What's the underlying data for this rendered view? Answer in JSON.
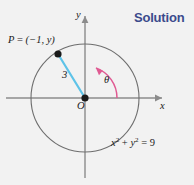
{
  "heading": {
    "text": "Solution",
    "color": "#3b4a8c"
  },
  "figure": {
    "background": "#f2f2f2",
    "axis_color": "#8c8c8c",
    "circle_color": "#6e6e6e",
    "radius_segment_color": "#5ec3e8",
    "angle_arc_color": "#e05a92",
    "point_color": "#1a1a1a",
    "labels": {
      "point_p": "P = (−1, y)",
      "point_p_plain": "P",
      "point_p_coords": "(−1, y)",
      "radius_value": "3",
      "angle_symbol": "θ",
      "origin": "O",
      "x_axis": "x",
      "y_axis": "y",
      "circle_equation": "x² + y² = 9",
      "circle_equation_lhs_x": "x",
      "circle_equation_lhs_y": "y",
      "circle_equation_exponent": "2",
      "circle_equation_rhs": "9"
    },
    "geometry": {
      "center_x": 85,
      "center_y": 98,
      "radius_px": 54,
      "point_p_x": 58,
      "point_p_y": 54,
      "point_p_math": [
        -1,
        2.828
      ],
      "circle_radius_math": 3,
      "angle_arc_start_deg": 0,
      "angle_arc_end_deg": 110
    }
  }
}
